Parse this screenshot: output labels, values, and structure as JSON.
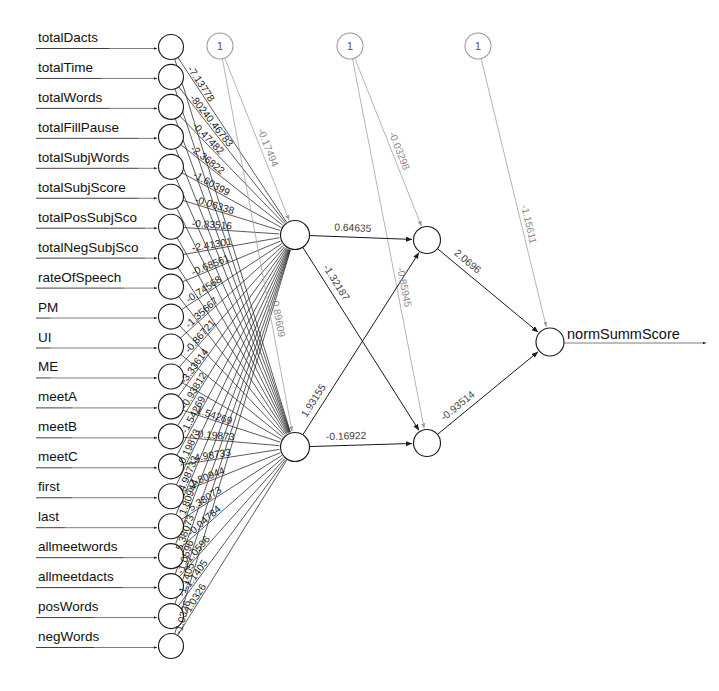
{
  "diagram": {
    "output_label": "normSummScore",
    "bias_node_label": "1",
    "colors": {
      "node_stroke": "#1d1d1d",
      "bias_stroke": "#9b9b9b",
      "edge_dark": "#232323",
      "edge_faint": "#a2a2a2",
      "text": "#101010"
    },
    "input_nodes": [
      {
        "label": "totalDacts"
      },
      {
        "label": "totalTime"
      },
      {
        "label": "totalWords"
      },
      {
        "label": "totalFillPause"
      },
      {
        "label": "totalSubjWords"
      },
      {
        "label": "totalSubjScore"
      },
      {
        "label": "totalPosSubjSco"
      },
      {
        "label": "totalNegSubjSco"
      },
      {
        "label": "rateOfSpeech"
      },
      {
        "label": "PM"
      },
      {
        "label": "UI"
      },
      {
        "label": "ME"
      },
      {
        "label": "meetA"
      },
      {
        "label": "meetB"
      },
      {
        "label": "meetC"
      },
      {
        "label": "first"
      },
      {
        "label": "last"
      },
      {
        "label": "allmeetwords"
      },
      {
        "label": "allmeetdacts"
      },
      {
        "label": "posWords"
      },
      {
        "label": "negWords"
      }
    ],
    "bias_nodes": [
      {
        "name": "bias-hidden-layer-1",
        "value": "1"
      },
      {
        "name": "bias-hidden-layer-2",
        "value": "1"
      },
      {
        "name": "bias-output-layer",
        "value": "1"
      }
    ],
    "hidden_layer_1": [
      {
        "name": "hidden-1-1"
      },
      {
        "name": "hidden-1-2"
      }
    ],
    "hidden_layer_2": [
      {
        "name": "hidden-2-1"
      },
      {
        "name": "hidden-2-2"
      }
    ],
    "output_nodes": [
      {
        "name": "output-1",
        "label": "normSummScore"
      }
    ],
    "bias_weights": [
      {
        "from": "bias-hidden-layer-1",
        "to": "hidden-1-1",
        "weight": "-0.17494"
      },
      {
        "from": "bias-hidden-layer-1",
        "to": "hidden-1-2",
        "weight": "0.89609"
      },
      {
        "from": "bias-hidden-layer-2",
        "to": "hidden-2-1",
        "weight": "-0.03298"
      },
      {
        "from": "bias-hidden-layer-2",
        "to": "hidden-2-2",
        "weight": "-0.85945"
      },
      {
        "from": "bias-output-layer",
        "to": "output-1",
        "weight": "-1.15611"
      }
    ],
    "hidden_weights": [
      {
        "from": "hidden-1-1",
        "to": "hidden-2-1",
        "weight": "0.64635"
      },
      {
        "from": "hidden-1-1",
        "to": "hidden-2-2",
        "weight": "-1.32187"
      },
      {
        "from": "hidden-1-2",
        "to": "hidden-2-1",
        "weight": "1.93155"
      },
      {
        "from": "hidden-1-2",
        "to": "hidden-2-2",
        "weight": "-0.16922"
      },
      {
        "from": "hidden-2-1",
        "to": "output-1",
        "weight": "2.0696"
      },
      {
        "from": "hidden-2-2",
        "to": "output-1",
        "weight": "-0.93514"
      }
    ],
    "input_weights_top": [
      "-7.13778",
      "-80240.46783",
      "-0.47482",
      "-2.36822",
      "-1.60399",
      "-0.06338",
      "-0.83516",
      "-2.41301",
      "-0.68561",
      "-0.74568",
      "-1.35667",
      "-0.86721",
      "-3.33614",
      "-0.93812",
      "-1.54269",
      "-0.19873",
      "4.98733",
      "1.80944",
      "5.38073",
      "-1.0596",
      "-1.1405",
      "-1.0326"
    ],
    "input_weights_bottom": [
      "-1.54269",
      "-0.19873",
      "4.98733",
      "1.80944",
      "5.38073",
      "-0.04784",
      "-1.0596",
      "-1.1405",
      "-1.0326"
    ]
  }
}
